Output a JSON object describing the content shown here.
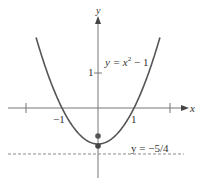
{
  "diagram": {
    "type": "parabola-graph",
    "axes": {
      "x_label": "x",
      "y_label": "y"
    },
    "ticks": {
      "x_neg1": "−1",
      "x_pos1": "1",
      "y_pos1": "1"
    },
    "curve_label": {
      "prefix": "y = x",
      "exp": "2",
      "suffix": " − 1"
    },
    "directrix_label": "y = −5/4",
    "curve_equation": "y = x^2 - 1",
    "vertex": [
      0,
      -1
    ],
    "focus": [
      0,
      -0.75
    ],
    "directrix": -1.25,
    "colors": {
      "curve": "#555555",
      "axis": "#666666",
      "point": "#555555",
      "dash": "#888888"
    }
  }
}
